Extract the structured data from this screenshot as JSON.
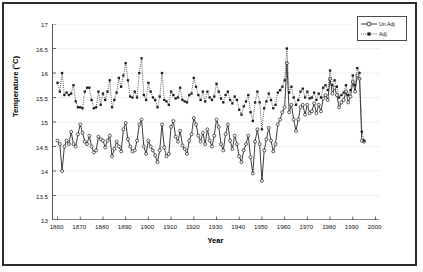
{
  "chart_data": {
    "type": "line",
    "title": "",
    "xlabel": "Year",
    "ylabel": "Temperature (°C)",
    "xlim": [
      1858,
      2002
    ],
    "ylim": [
      13,
      17
    ],
    "xticks": [
      1860,
      1870,
      1880,
      1890,
      1900,
      1910,
      1920,
      1930,
      1940,
      1950,
      1960,
      1970,
      1980,
      1990,
      2000
    ],
    "yticks": [
      13,
      13.5,
      14,
      14.5,
      15,
      15.5,
      16,
      16.5,
      17
    ],
    "grid": "horizontal-light",
    "legend_position": "top-right",
    "x": [
      1860,
      1861,
      1862,
      1863,
      1864,
      1865,
      1866,
      1867,
      1868,
      1869,
      1870,
      1871,
      1872,
      1873,
      1874,
      1875,
      1876,
      1877,
      1878,
      1879,
      1880,
      1881,
      1882,
      1883,
      1884,
      1885,
      1886,
      1887,
      1888,
      1889,
      1890,
      1891,
      1892,
      1893,
      1894,
      1895,
      1896,
      1897,
      1898,
      1899,
      1900,
      1901,
      1902,
      1903,
      1904,
      1905,
      1906,
      1907,
      1908,
      1909,
      1910,
      1911,
      1912,
      1913,
      1914,
      1915,
      1916,
      1917,
      1918,
      1919,
      1920,
      1921,
      1922,
      1923,
      1924,
      1925,
      1926,
      1927,
      1928,
      1929,
      1930,
      1931,
      1932,
      1933,
      1934,
      1935,
      1936,
      1937,
      1938,
      1939,
      1940,
      1941,
      1942,
      1943,
      1944,
      1945,
      1946,
      1947,
      1948,
      1949,
      1950,
      1951,
      1952,
      1953,
      1954,
      1955,
      1956,
      1957,
      1958,
      1959,
      1960,
      1961,
      1962,
      1963,
      1964,
      1965,
      1966,
      1967,
      1968,
      1969,
      1970,
      1971,
      1972,
      1973,
      1974,
      1975,
      1976,
      1977,
      1978,
      1979,
      1980,
      1981,
      1982,
      1983,
      1984,
      1985,
      1986,
      1987,
      1988,
      1989,
      1990,
      1991,
      1992,
      1993,
      1994,
      1995
    ],
    "series": [
      {
        "name": "Un Adj",
        "marker": "open-circle",
        "line": "solid",
        "color": "#1a1a1a",
        "values": [
          14.62,
          14.55,
          14.0,
          14.5,
          14.62,
          14.55,
          14.8,
          14.55,
          14.5,
          14.75,
          14.95,
          14.78,
          14.6,
          14.55,
          14.72,
          14.5,
          14.38,
          14.42,
          14.7,
          14.65,
          14.62,
          14.48,
          14.62,
          14.72,
          14.3,
          14.45,
          14.6,
          14.5,
          14.4,
          14.85,
          14.98,
          14.65,
          14.5,
          14.4,
          14.42,
          14.62,
          14.95,
          15.05,
          14.5,
          14.35,
          14.62,
          14.5,
          14.42,
          14.32,
          14.18,
          14.42,
          14.95,
          14.48,
          14.3,
          14.35,
          14.9,
          15.02,
          14.7,
          14.6,
          14.82,
          14.52,
          14.45,
          14.35,
          14.62,
          14.75,
          15.08,
          14.95,
          14.72,
          14.6,
          14.78,
          14.55,
          14.85,
          14.62,
          14.5,
          14.72,
          15.05,
          14.9,
          14.55,
          14.42,
          14.75,
          14.95,
          14.62,
          14.45,
          14.72,
          14.55,
          14.3,
          14.18,
          14.42,
          14.55,
          14.72,
          14.28,
          13.95,
          14.6,
          14.85,
          14.55,
          13.8,
          14.42,
          14.65,
          14.88,
          14.62,
          14.4,
          14.55,
          14.95,
          15.05,
          15.2,
          15.3,
          16.2,
          15.2,
          15.35,
          15.05,
          14.82,
          15.05,
          15.3,
          15.35,
          15.15,
          15.35,
          15.18,
          15.22,
          15.38,
          15.18,
          15.35,
          15.22,
          15.48,
          15.55,
          15.45,
          15.88,
          15.58,
          15.7,
          15.55,
          15.3,
          15.4,
          15.45,
          15.62,
          15.4,
          15.52,
          15.82,
          15.62,
          15.95,
          15.88,
          14.62,
          14.6
        ]
      },
      {
        "name": "Adj",
        "marker": "filled-square",
        "line": "dotted",
        "color": "#1a1a1a",
        "values": [
          15.8,
          15.62,
          16.0,
          15.55,
          15.6,
          15.55,
          15.58,
          15.75,
          15.42,
          15.3,
          15.3,
          15.28,
          15.62,
          15.7,
          15.7,
          15.45,
          15.28,
          15.3,
          15.62,
          15.35,
          15.58,
          15.45,
          15.62,
          15.85,
          15.3,
          15.45,
          15.6,
          15.9,
          15.72,
          15.95,
          16.2,
          15.85,
          15.52,
          15.5,
          15.62,
          15.5,
          16.0,
          16.3,
          15.55,
          15.45,
          15.8,
          15.62,
          15.5,
          15.45,
          15.3,
          15.52,
          16.0,
          15.45,
          15.42,
          15.35,
          15.62,
          15.55,
          15.48,
          15.5,
          15.7,
          15.45,
          15.42,
          15.4,
          15.55,
          15.58,
          15.9,
          15.72,
          15.55,
          15.45,
          15.62,
          15.42,
          15.62,
          15.5,
          15.45,
          15.52,
          15.78,
          15.62,
          15.48,
          15.4,
          15.55,
          15.62,
          15.45,
          15.38,
          15.52,
          15.45,
          15.25,
          15.15,
          15.32,
          15.42,
          15.55,
          15.2,
          15.02,
          15.4,
          15.62,
          15.4,
          14.85,
          15.28,
          15.42,
          15.58,
          15.45,
          15.28,
          15.35,
          15.6,
          15.65,
          15.72,
          15.85,
          16.5,
          15.6,
          15.72,
          15.5,
          15.35,
          15.45,
          15.62,
          15.68,
          15.5,
          15.62,
          15.48,
          15.5,
          15.6,
          15.45,
          15.58,
          15.5,
          15.7,
          15.75,
          15.65,
          16.05,
          15.75,
          15.85,
          15.72,
          15.5,
          15.55,
          15.6,
          15.75,
          15.55,
          15.65,
          15.95,
          15.75,
          16.1,
          16.0,
          14.8,
          14.62
        ]
      }
    ]
  }
}
